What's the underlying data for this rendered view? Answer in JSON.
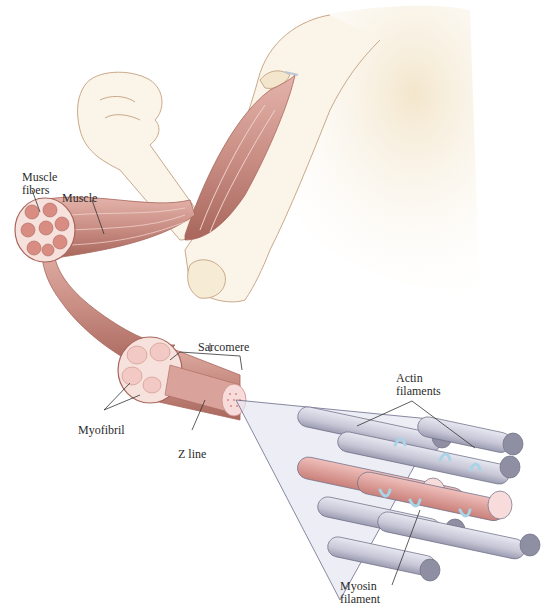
{
  "diagram": {
    "labels": {
      "muscle_fibers": "Muscle\nfibers",
      "muscle": "Muscle",
      "sarcomere": "Sarcomere",
      "myofibril": "Myofibril",
      "z_line": "Z line",
      "actin_filaments": "Actin\nfilaments",
      "myosin_filament": "Myosin\nfilament"
    },
    "colors": {
      "skin": "#f8f0de",
      "skin_outline": "#c9a98a",
      "muscle": "#c98e84",
      "muscle_dark": "#a8665c",
      "fiber_cross_section": "#f2c9c4",
      "actin": "#c6c6d6",
      "actin_end": "#8f8fa3",
      "myosin": "#dc9a96",
      "myosin_end": "#f7dcdb",
      "cross_bridge": "#a9d3e6",
      "leader_line": "#333333"
    }
  }
}
